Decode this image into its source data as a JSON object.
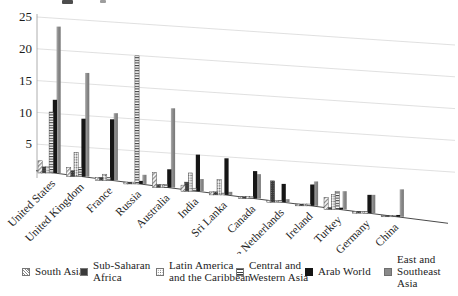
{
  "figure": {
    "background": "#ffffff"
  },
  "colors": {
    "bar_black": "#161616",
    "bar_gray": "#8a8a8a",
    "pattern_ink": "#454545",
    "gridline": "#dcdcdc",
    "axis_line": "#9a9a9a",
    "floor_line": "#4a4a4a",
    "text": "#1c1c1c"
  },
  "chart_data": {
    "type": "bar",
    "style": "3d-perspective-monochrome-patterns",
    "title": "",
    "xlabel": "",
    "ylabel": "",
    "ylim": [
      0,
      25
    ],
    "yticks": [
      5,
      10,
      15,
      20,
      25
    ],
    "grid": true,
    "legend_position": "bottom",
    "categories": [
      "United States",
      "United Kingdom",
      "France",
      "Russia",
      "Australia",
      "India",
      "Sri Lanka",
      "Canada",
      "The Netherlands",
      "Ireland",
      "Turkey",
      "Germany",
      "China"
    ],
    "series": [
      {
        "name": "South Asia",
        "legend_label": "South Asia",
        "pattern": "diagonal-hatch",
        "values": [
          2,
          1.5,
          0.5,
          0.3,
          2.5,
          1,
          0.5,
          0.3,
          0.3,
          0.3,
          2,
          0.3,
          0.2
        ]
      },
      {
        "name": "Sub-Saharan Africa",
        "legend_label": "Sub-Saharan\nAfrica",
        "pattern": "dark-dotted",
        "values": [
          1,
          1,
          0.5,
          0.3,
          0.5,
          1.5,
          0.5,
          0.3,
          3.5,
          0.3,
          0.3,
          0.3,
          0.2
        ]
      },
      {
        "name": "Latin America and the Caribbean",
        "legend_label": "Latin America\nand the Caribbean",
        "pattern": "light-dotted",
        "values": [
          1,
          4,
          1,
          0.3,
          0.5,
          3,
          2.5,
          0.3,
          0.3,
          0.3,
          2.5,
          0.3,
          0.2
        ]
      },
      {
        "name": "Central and Western Asia",
        "legend_label": "Central and\nWestern Asia",
        "pattern": "horizontal-stripes",
        "values": [
          10,
          1.5,
          0.5,
          21,
          0.5,
          0.5,
          0.3,
          0.3,
          0.3,
          0.3,
          3,
          0.3,
          0.2
        ]
      },
      {
        "name": "Arab World",
        "legend_label": "Arab World",
        "pattern": "solid-black",
        "values": [
          12,
          9.5,
          10,
          0.5,
          3,
          6,
          6,
          4.5,
          3,
          3.5,
          0.3,
          3,
          0.3
        ]
      },
      {
        "name": "East and Southeast Asia",
        "legend_label": "East and\nSoutheast Asia",
        "pattern": "solid-gray",
        "values": [
          24,
          17,
          11,
          1.5,
          13,
          2,
          0.5,
          4,
          0.5,
          4,
          3,
          3,
          4.5
        ]
      }
    ]
  }
}
